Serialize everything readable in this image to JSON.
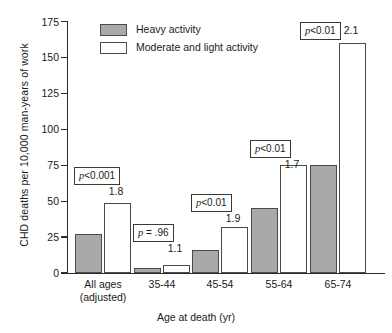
{
  "chart_data": {
    "type": "bar",
    "title": "",
    "xlabel": "Age at death (yr)",
    "ylabel": "CHD deaths per 10,000 man-years of work",
    "ylim": [
      0,
      175
    ],
    "yticks": [
      0,
      25,
      50,
      75,
      100,
      125,
      150,
      175
    ],
    "grid": false,
    "legend_position": "top-left",
    "categories": [
      "All ages\n(adjusted)",
      "35-44",
      "45-54",
      "55-64",
      "65-74"
    ],
    "series": [
      {
        "name": "Heavy activity",
        "color": "#a9a9a9",
        "values": [
          27,
          3.5,
          16,
          45,
          75
        ]
      },
      {
        "name": "Moderate and light activity",
        "color": "#ffffff",
        "values": [
          49,
          5.5,
          32,
          75,
          160
        ]
      }
    ],
    "annotations": {
      "ratios": [
        "1.8",
        "1.1",
        "1.9",
        "1.7",
        "2.1"
      ],
      "p_values": [
        "p<0.001",
        "p = .96",
        "p<0.01",
        "p<0.01",
        "p<0.01"
      ]
    }
  },
  "axes": {
    "ylabel": "CHD deaths per 10,000 man-years of work",
    "xlabel": "Age at death (yr)",
    "yticks": [
      {
        "value": "175"
      },
      {
        "value": "150"
      },
      {
        "value": "125"
      },
      {
        "value": "100"
      },
      {
        "value": "75"
      },
      {
        "value": "50"
      },
      {
        "value": "25"
      },
      {
        "value": "0"
      }
    ]
  },
  "legend": {
    "items": [
      {
        "label": "Heavy activity",
        "color": "#a9a9a9"
      },
      {
        "label": "Moderate and light activity",
        "color": "#ffffff"
      }
    ]
  },
  "groups": [
    {
      "label_line1": "All ages",
      "label_line2": "(adjusted)",
      "ratio": "1.8",
      "p_prefix": "p",
      "p_rest": "<0.001"
    },
    {
      "label_line1": "35-44",
      "label_line2": "",
      "ratio": "1.1",
      "p_prefix": "p",
      "p_rest": " = .96"
    },
    {
      "label_line1": "45-54",
      "label_line2": "",
      "ratio": "1.9",
      "p_prefix": "p",
      "p_rest": "<0.01"
    },
    {
      "label_line1": "55-64",
      "label_line2": "",
      "ratio": "1.7",
      "p_prefix": "p",
      "p_rest": "<0.01"
    },
    {
      "label_line1": "65-74",
      "label_line2": "",
      "ratio": "2.1",
      "p_prefix": "p",
      "p_rest": "<0.01"
    }
  ]
}
